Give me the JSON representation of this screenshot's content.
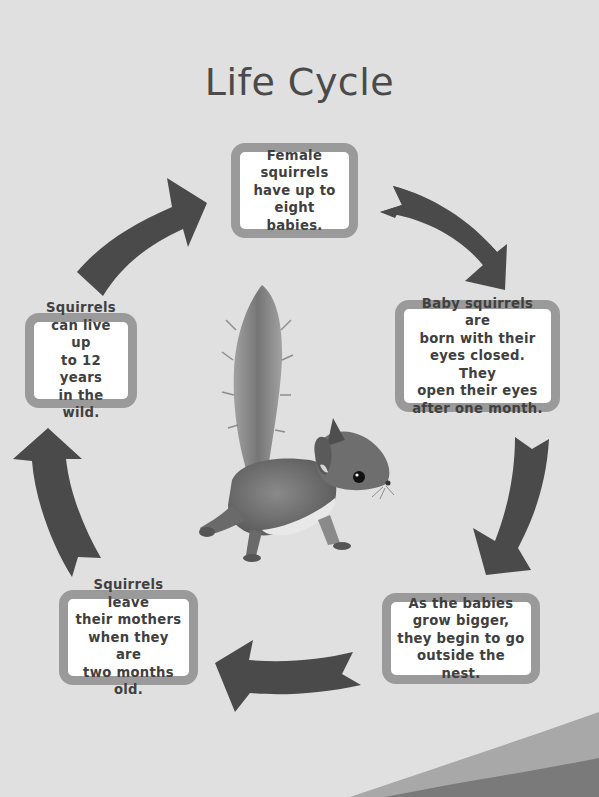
{
  "title": "Life Cycle",
  "colors": {
    "background": "#e0e0e0",
    "box_border": "#9a9a9a",
    "box_fill": "#ffffff",
    "text": "#404040",
    "arrow": "#4a4a4a",
    "wave_light": "#a8a8a8",
    "wave_dark": "#7a7a7a"
  },
  "stages": [
    {
      "id": 1,
      "lines": [
        "Female",
        "squirrels",
        "have up to",
        "eight babies."
      ]
    },
    {
      "id": 2,
      "lines": [
        "Baby squirrels are",
        "born with their",
        "eyes closed. They",
        "open their eyes",
        "after one month."
      ]
    },
    {
      "id": 3,
      "lines": [
        "As the babies",
        "grow bigger,",
        "they begin to go",
        "outside the nest."
      ]
    },
    {
      "id": 4,
      "lines": [
        "Squirrels leave",
        "their mothers",
        "when they are",
        "two months old."
      ]
    },
    {
      "id": 5,
      "lines": [
        "Squirrels",
        "can live up",
        "to 12 years",
        "in the wild."
      ]
    }
  ],
  "arrows": [
    {
      "from": 1,
      "to": 2,
      "icon": "curved-arrow-down-right"
    },
    {
      "from": 2,
      "to": 3,
      "icon": "curved-arrow-down-left"
    },
    {
      "from": 3,
      "to": 4,
      "icon": "curved-arrow-left"
    },
    {
      "from": 4,
      "to": 5,
      "icon": "curved-arrow-up"
    },
    {
      "from": 5,
      "to": 1,
      "icon": "curved-arrow-up-right"
    }
  ],
  "center_image": "squirrel-photo"
}
